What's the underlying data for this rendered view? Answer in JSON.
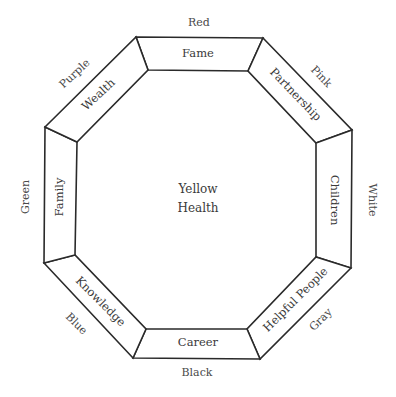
{
  "diagram": {
    "center": {
      "color_label": "Yellow",
      "area_label": "Health",
      "x": 198,
      "y": 198
    },
    "outer_octagon": [
      [
        136,
        37
      ],
      [
        263,
        38
      ],
      [
        352,
        130
      ],
      [
        351,
        268
      ],
      [
        260,
        359
      ],
      [
        133,
        358
      ],
      [
        44,
        263
      ],
      [
        45,
        127
      ]
    ],
    "inner_octagon": [
      [
        148,
        70
      ],
      [
        248,
        71
      ],
      [
        316,
        143
      ],
      [
        316,
        257
      ],
      [
        247,
        329
      ],
      [
        146,
        329
      ],
      [
        75,
        255
      ],
      [
        77,
        142
      ]
    ],
    "segments": [
      {
        "id": "fame",
        "area_label": "Fame",
        "color_label": "Red",
        "area_pos": [
          198,
          54
        ],
        "area_rot": 0,
        "color_pos": [
          199,
          23
        ],
        "color_rot": 0
      },
      {
        "id": "partnership",
        "area_label": "Partnership",
        "color_label": "Pink",
        "area_pos": [
          295,
          95
        ],
        "area_rot": 46,
        "color_pos": [
          321,
          77
        ],
        "color_rot": 46
      },
      {
        "id": "children",
        "area_label": "Children",
        "color_label": "White",
        "area_pos": [
          334,
          200
        ],
        "area_rot": 90,
        "color_pos": [
          372,
          200
        ],
        "color_rot": 90
      },
      {
        "id": "helpful-people",
        "area_label": "Helpful People",
        "color_label": "Gray",
        "area_pos": [
          296,
          300
        ],
        "area_rot": -45,
        "color_pos": [
          321,
          320
        ],
        "color_rot": -45
      },
      {
        "id": "career",
        "area_label": "Career",
        "color_label": "Black",
        "area_pos": [
          198,
          343
        ],
        "area_rot": 0,
        "color_pos": [
          197,
          373
        ],
        "color_rot": 0
      },
      {
        "id": "knowledge",
        "area_label": "Knowledge",
        "color_label": "Blue",
        "area_pos": [
          100,
          302
        ],
        "area_rot": 45,
        "color_pos": [
          76,
          324
        ],
        "color_rot": 45
      },
      {
        "id": "family",
        "area_label": "Family",
        "color_label": "Green",
        "area_pos": [
          60,
          197
        ],
        "area_rot": -90,
        "color_pos": [
          26,
          197
        ],
        "color_rot": -90
      },
      {
        "id": "wealth",
        "area_label": "Wealth",
        "color_label": "Purple",
        "area_pos": [
          99,
          95
        ],
        "area_rot": -43,
        "color_pos": [
          75,
          74
        ],
        "color_rot": -43
      }
    ],
    "colors": {
      "stroke": "#2a2a2a",
      "text": "#3a3a3a",
      "background": "#ffffff"
    }
  }
}
